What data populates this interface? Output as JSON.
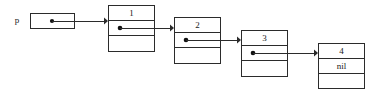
{
  "diagram": {
    "type": "linked-list",
    "background_color": "#ffffff",
    "line_color": "#2b2b2b",
    "text_color": "#1a1a1a",
    "dot_color": "#111111",
    "pointer_variable": {
      "label": "p",
      "box": {
        "x": 30,
        "y": 13,
        "width": 44,
        "height": 15
      },
      "dot": {
        "cx": 52,
        "cy": 20.5,
        "r": 2.1
      },
      "label_pos": {
        "x": 17,
        "y": 20.5
      }
    },
    "nodes": [
      {
        "name": "node-1",
        "value": "1",
        "pointer_cell": "",
        "third_cell": "",
        "box": {
          "x": 108,
          "y": 5,
          "width": 46,
          "height": 46
        },
        "divider_ys": [
          20,
          35
        ],
        "value_pos": {
          "x": 131,
          "y": 12.5
        },
        "dot": {
          "cx": 120,
          "cy": 27.5,
          "r": 2.3
        }
      },
      {
        "name": "node-2",
        "value": "2",
        "pointer_cell": "",
        "third_cell": "",
        "box": {
          "x": 174,
          "y": 17,
          "width": 46,
          "height": 46
        },
        "divider_ys": [
          32,
          47
        ],
        "value_pos": {
          "x": 197,
          "y": 24.5
        },
        "dot": {
          "cx": 186,
          "cy": 39.5,
          "r": 2.3
        }
      },
      {
        "name": "node-3",
        "value": "3",
        "pointer_cell": "",
        "third_cell": "",
        "box": {
          "x": 241,
          "y": 30,
          "width": 46,
          "height": 46
        },
        "divider_ys": [
          45,
          60
        ],
        "value_pos": {
          "x": 264,
          "y": 37.5
        },
        "dot": {
          "cx": 253,
          "cy": 52.5,
          "r": 2.3
        }
      },
      {
        "name": "node-4",
        "value": "4",
        "pointer_cell": "nil",
        "third_cell": "",
        "box": {
          "x": 318,
          "y": 43,
          "width": 46,
          "height": 45
        },
        "divider_ys": [
          58,
          73
        ],
        "value_pos": {
          "x": 341,
          "y": 50.5
        },
        "nil_pos": {
          "x": 341,
          "y": 65.5
        }
      }
    ],
    "arrows": [
      {
        "name": "arrow-p-to-node-1",
        "from": {
          "x": 52,
          "y": 20.5
        },
        "to": {
          "x": 108,
          "y": 20.5
        }
      },
      {
        "name": "arrow-node-1-to-node-2",
        "from": {
          "x": 120,
          "y": 27.5
        },
        "to": {
          "x": 174,
          "y": 27.5
        }
      },
      {
        "name": "arrow-node-2-to-node-3",
        "from": {
          "x": 186,
          "y": 39.5
        },
        "to": {
          "x": 241,
          "y": 39.5
        }
      },
      {
        "name": "arrow-node-3-to-node-4",
        "from": {
          "x": 253,
          "y": 52.5
        },
        "to": {
          "x": 318,
          "y": 52.5
        }
      }
    ]
  }
}
